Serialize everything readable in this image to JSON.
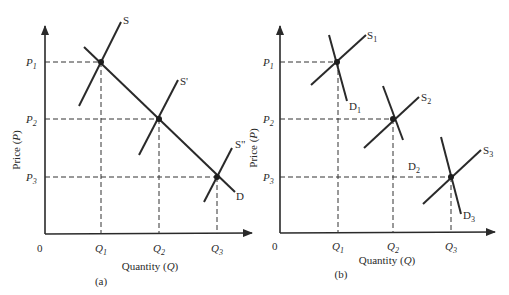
{
  "panels": [
    {
      "id": "a",
      "caption": "(a)",
      "ylabel": "Price (P)",
      "xlabel": "Quantity (Q)",
      "origin_label": "0",
      "price_ticks": [
        "P1",
        "P2",
        "P3"
      ],
      "quantity_ticks": [
        "Q1",
        "Q2",
        "Q3"
      ],
      "curves": [
        {
          "name": "S",
          "type": "supply"
        },
        {
          "name": "S'",
          "type": "supply"
        },
        {
          "name": "S\"",
          "type": "supply"
        },
        {
          "name": "D",
          "type": "demand"
        }
      ],
      "equilibria": [
        {
          "P": "P1",
          "Q": "Q1",
          "curves": [
            "S",
            "D"
          ]
        },
        {
          "P": "P2",
          "Q": "Q2",
          "curves": [
            "S'",
            "D"
          ]
        },
        {
          "P": "P3",
          "Q": "Q3",
          "curves": [
            "S\"",
            "D"
          ]
        }
      ]
    },
    {
      "id": "b",
      "caption": "(b)",
      "ylabel": "Price (P)",
      "xlabel": "Quantity (Q)",
      "origin_label": "0",
      "price_ticks": [
        "P1",
        "P2",
        "P3"
      ],
      "quantity_ticks": [
        "Q1",
        "Q2",
        "Q3"
      ],
      "curves": [
        {
          "name": "S1",
          "type": "supply"
        },
        {
          "name": "D1",
          "type": "demand"
        },
        {
          "name": "S2",
          "type": "supply"
        },
        {
          "name": "D2",
          "type": "demand"
        },
        {
          "name": "S3",
          "type": "supply"
        },
        {
          "name": "D3",
          "type": "demand"
        }
      ],
      "equilibria": [
        {
          "P": "P1",
          "Q": "Q1",
          "curves": [
            "S1",
            "D1"
          ]
        },
        {
          "P": "P2",
          "Q": "Q2",
          "curves": [
            "S2",
            "D2"
          ]
        },
        {
          "P": "P3",
          "Q": "Q3",
          "curves": [
            "S3",
            "D3"
          ]
        }
      ]
    }
  ],
  "labels": {
    "a": {
      "ylabel": "Price (",
      "ylabel_var": "P",
      "ylabel_close": ")",
      "xlabel": "Quantity (",
      "xlabel_var": "Q",
      "xlabel_close": ")",
      "caption": "(a)",
      "origin": "0",
      "P": "P",
      "Q": "Q",
      "s1": "1",
      "s2": "2",
      "s3": "3",
      "S": "S",
      "S_prime": "S'",
      "S_dprime": "S\"",
      "D": "D"
    },
    "b": {
      "ylabel": "Price (",
      "ylabel_var": "P",
      "ylabel_close": ")",
      "xlabel": "Quantity (",
      "xlabel_var": "Q",
      "xlabel_close": ")",
      "caption": "(b)",
      "origin": "0",
      "P": "P",
      "Q": "Q",
      "s1": "1",
      "s2": "2",
      "s3": "3",
      "S": "S",
      "D": "D"
    }
  }
}
